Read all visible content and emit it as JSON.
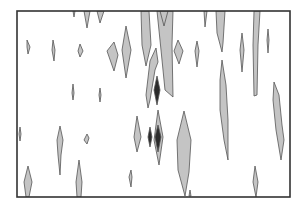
{
  "chart_data": {
    "type": "contour",
    "title": "",
    "xlabel": "",
    "ylabel": "",
    "grid": false,
    "legend": null,
    "frame": {
      "x": 17,
      "y": 11,
      "width": 273,
      "height": 186,
      "stroke": "#333333",
      "stroke_width": 1.6
    },
    "fill_colors": {
      "level1": "#c4c4c4",
      "level2": "#2b2b2b"
    },
    "outline_color": "#555555",
    "contours": [
      {
        "level": 1,
        "points": [
          [
            73,
            11
          ],
          [
            75,
            11
          ],
          [
            74,
            17
          ]
        ]
      },
      {
        "level": 1,
        "points": [
          [
            84,
            11
          ],
          [
            90,
            11
          ],
          [
            87,
            28
          ]
        ]
      },
      {
        "level": 1,
        "points": [
          [
            97,
            11
          ],
          [
            104,
            11
          ],
          [
            100,
            23
          ]
        ]
      },
      {
        "level": 1,
        "points": [
          [
            27,
            40
          ],
          [
            30,
            47
          ],
          [
            28,
            54
          ],
          [
            27,
            47
          ]
        ]
      },
      {
        "level": 1,
        "points": [
          [
            53,
            40
          ],
          [
            55,
            50
          ],
          [
            54,
            61
          ],
          [
            52,
            50
          ]
        ]
      },
      {
        "level": 1,
        "points": [
          [
            80,
            44
          ],
          [
            83,
            51
          ],
          [
            80,
            57
          ],
          [
            78,
            51
          ]
        ]
      },
      {
        "level": 1,
        "points": [
          [
            114,
            42
          ],
          [
            118,
            55
          ],
          [
            114,
            71
          ],
          [
            107,
            51
          ]
        ]
      },
      {
        "level": 1,
        "points": [
          [
            126,
            26
          ],
          [
            131,
            50
          ],
          [
            126,
            78
          ],
          [
            122,
            50
          ]
        ]
      },
      {
        "level": 1,
        "points": [
          [
            141,
            11
          ],
          [
            149,
            11
          ],
          [
            151,
            45
          ],
          [
            146,
            66
          ],
          [
            142,
            45
          ]
        ]
      },
      {
        "level": 1,
        "points": [
          [
            157,
            11
          ],
          [
            173,
            11
          ],
          [
            172,
            45
          ],
          [
            173,
            97
          ],
          [
            165,
            90
          ],
          [
            161,
            50
          ]
        ]
      },
      {
        "level": 1,
        "points": [
          [
            160,
            11
          ],
          [
            168,
            11
          ],
          [
            164,
            26
          ]
        ]
      },
      {
        "level": 1,
        "points": [
          [
            178,
            40
          ],
          [
            183,
            51
          ],
          [
            179,
            64
          ],
          [
            174,
            51
          ]
        ]
      },
      {
        "level": 1,
        "points": [
          [
            197,
            41
          ],
          [
            199,
            51
          ],
          [
            197,
            67
          ],
          [
            195,
            51
          ]
        ]
      },
      {
        "level": 1,
        "points": [
          [
            204,
            11
          ],
          [
            207,
            11
          ],
          [
            205,
            27
          ]
        ]
      },
      {
        "level": 1,
        "points": [
          [
            216,
            11
          ],
          [
            225,
            11
          ],
          [
            223,
            43
          ],
          [
            222,
            52
          ],
          [
            217,
            33
          ]
        ]
      },
      {
        "level": 1,
        "points": [
          [
            242,
            33
          ],
          [
            244,
            50
          ],
          [
            242,
            72
          ],
          [
            240,
            50
          ]
        ]
      },
      {
        "level": 1,
        "points": [
          [
            254,
            11
          ],
          [
            260,
            11
          ],
          [
            258,
            45
          ],
          [
            257,
            95
          ],
          [
            254,
            96
          ],
          [
            253,
            45
          ]
        ]
      },
      {
        "level": 1,
        "points": [
          [
            268,
            29
          ],
          [
            269,
            40
          ],
          [
            268,
            53
          ],
          [
            267,
            40
          ]
        ]
      },
      {
        "level": 1,
        "points": [
          [
            150,
            61
          ],
          [
            156,
            48
          ],
          [
            158,
            62
          ],
          [
            155,
            70
          ],
          [
            150,
            100
          ],
          [
            148,
            108
          ],
          [
            146,
            95
          ]
        ]
      },
      {
        "level": 2,
        "points": [
          [
            157,
            76
          ],
          [
            160,
            90
          ],
          [
            157,
            105
          ],
          [
            154,
            90
          ]
        ]
      },
      {
        "level": 1,
        "points": [
          [
            73,
            84
          ],
          [
            74,
            93
          ],
          [
            73,
            100
          ],
          [
            72,
            93
          ]
        ]
      },
      {
        "level": 1,
        "points": [
          [
            100,
            88
          ],
          [
            101,
            95
          ],
          [
            100,
            102
          ],
          [
            99,
            95
          ]
        ]
      },
      {
        "level": 1,
        "points": [
          [
            222,
            60
          ],
          [
            226,
            85
          ],
          [
            228,
            120
          ],
          [
            228,
            160
          ],
          [
            224,
            140
          ],
          [
            220,
            110
          ],
          [
            220,
            80
          ]
        ]
      },
      {
        "level": 1,
        "points": [
          [
            274,
            82
          ],
          [
            279,
            95
          ],
          [
            282,
            125
          ],
          [
            284,
            140
          ],
          [
            281,
            160
          ],
          [
            276,
            130
          ],
          [
            273,
            100
          ]
        ]
      },
      {
        "level": 1,
        "points": [
          [
            20,
            127
          ],
          [
            21,
            134
          ],
          [
            20,
            141
          ],
          [
            19,
            134
          ]
        ]
      },
      {
        "level": 1,
        "points": [
          [
            60,
            126
          ],
          [
            63,
            140
          ],
          [
            61,
            155
          ],
          [
            60,
            175
          ],
          [
            58,
            155
          ],
          [
            57,
            140
          ]
        ]
      },
      {
        "level": 1,
        "points": [
          [
            87,
            134
          ],
          [
            89,
            138
          ],
          [
            87,
            144
          ],
          [
            84,
            140
          ]
        ]
      },
      {
        "level": 1,
        "points": [
          [
            137,
            116
          ],
          [
            141,
            137
          ],
          [
            137,
            152
          ],
          [
            134,
            137
          ]
        ]
      },
      {
        "level": 2,
        "points": [
          [
            150,
            127
          ],
          [
            152,
            137
          ],
          [
            150,
            147
          ],
          [
            148,
            137
          ]
        ]
      },
      {
        "level": 1,
        "points": [
          [
            158,
            110
          ],
          [
            163,
            137
          ],
          [
            159,
            165
          ],
          [
            154,
            140
          ]
        ]
      },
      {
        "level": 2,
        "points": [
          [
            158,
            125
          ],
          [
            161,
            137
          ],
          [
            158,
            152
          ],
          [
            155,
            137
          ]
        ]
      },
      {
        "level": 1,
        "points": [
          [
            184,
            111
          ],
          [
            191,
            140
          ],
          [
            189,
            172
          ],
          [
            185,
            196
          ],
          [
            178,
            170
          ],
          [
            177,
            140
          ]
        ]
      },
      {
        "level": 1,
        "points": [
          [
            28,
            166
          ],
          [
            32,
            182
          ],
          [
            29,
            197
          ],
          [
            26,
            197
          ],
          [
            24,
            182
          ]
        ]
      },
      {
        "level": 1,
        "points": [
          [
            79,
            160
          ],
          [
            82,
            182
          ],
          [
            81,
            197
          ],
          [
            77,
            197
          ],
          [
            76,
            182
          ]
        ]
      },
      {
        "level": 1,
        "points": [
          [
            131,
            170
          ],
          [
            132,
            177
          ],
          [
            131,
            187
          ],
          [
            129,
            177
          ]
        ]
      },
      {
        "level": 1,
        "points": [
          [
            255,
            166
          ],
          [
            258,
            182
          ],
          [
            256,
            197
          ],
          [
            253,
            182
          ]
        ]
      },
      {
        "level": 1,
        "points": [
          [
            190,
            190
          ],
          [
            191,
            196
          ],
          [
            189,
            196
          ]
        ]
      }
    ]
  }
}
